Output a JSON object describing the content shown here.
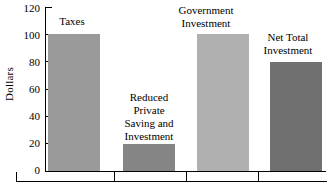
{
  "chart_data": {
    "type": "bar",
    "title": "",
    "xlabel": "",
    "ylabel": "Dollars",
    "ylim": [
      0,
      120
    ],
    "ytick_values": [
      0,
      20,
      40,
      60,
      80,
      100,
      120
    ],
    "ytick_labels": [
      "0",
      "20",
      "40",
      "60",
      "80",
      "100",
      "120"
    ],
    "grid": false,
    "legend": "none",
    "categories": [
      "Taxes",
      "Reduced Private Saving and Investment",
      "Government Investment",
      "Net Total Investment"
    ],
    "values": [
      100,
      20,
      100,
      80
    ],
    "bar_labels": [
      "Taxes",
      "Reduced\nPrivate\nSaving and\nInvestment",
      "Government\nInvestment",
      "Net Total\nInvestment"
    ],
    "bar_colors": [
      "#9a9a9a",
      "#858585",
      "#b0b0b0",
      "#707070"
    ],
    "axis_color": "#000000",
    "background_color": "#ffffff"
  }
}
